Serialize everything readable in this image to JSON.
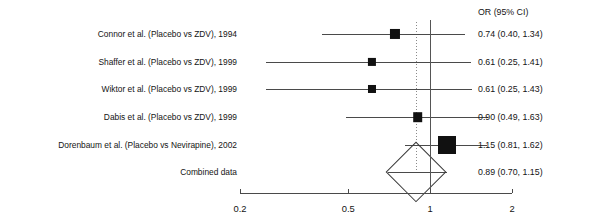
{
  "figure": {
    "type": "forest-plot",
    "title": "",
    "or_header": "OR (95% CI)",
    "x_axis": {
      "scale": "log",
      "ticks": [
        "0.2",
        "0.5",
        "1",
        "2"
      ],
      "tick_values": [
        0.2,
        0.5,
        1,
        2
      ],
      "range": [
        0.2,
        2.0
      ],
      "label": ""
    },
    "null_line_value": 1,
    "summary_line_value": 0.89
  },
  "chart_data": {
    "type": "forest",
    "title": "",
    "xlabel": "",
    "ylabel": "",
    "xscale": "log",
    "xlim": [
      0.2,
      2.0
    ],
    "xticks": [
      0.2,
      0.5,
      1,
      2
    ],
    "xticklabels": [
      "0.2",
      "0.5",
      "1",
      "2"
    ],
    "grid": false,
    "legend": "none",
    "null_line": 1,
    "effect_measure": "OR (95% CI)",
    "rows": [
      {
        "label": "Connor et al. (Placebo vs ZDV), 1994",
        "or": 0.74,
        "lcl": 0.4,
        "ucl": 1.34,
        "or_text": "0.74 (0.40, 1.34)",
        "marker": "square",
        "weight": 0.34
      },
      {
        "label": "Shaffer et al. (Placebo vs ZDV), 1999",
        "or": 0.61,
        "lcl": 0.25,
        "ucl": 1.41,
        "or_text": "0.61 (0.25, 1.41)",
        "marker": "square",
        "weight": 0.18
      },
      {
        "label": "Wiktor et al. (Placebo vs ZDV), 1999",
        "or": 0.61,
        "lcl": 0.25,
        "ucl": 1.43,
        "or_text": "0.61 (0.25, 1.43)",
        "marker": "square",
        "weight": 0.17
      },
      {
        "label": "Dabis et al. (Placebo vs ZDV), 1999",
        "or": 0.9,
        "lcl": 0.49,
        "ucl": 1.63,
        "or_text": "0.90 (0.49, 1.63)",
        "marker": "square",
        "weight": 0.3
      },
      {
        "label": "Dorenbaum et al. (Placebo vs Nevirapine), 2002",
        "or": 1.15,
        "lcl": 0.81,
        "ucl": 1.62,
        "or_text": "1.15 (0.81, 1.62)",
        "marker": "square",
        "weight": 1.0
      },
      {
        "label": "Combined data",
        "or": 0.89,
        "lcl": 0.7,
        "ucl": 1.15,
        "or_text": "0.89 (0.70, 1.15)",
        "marker": "diamond",
        "weight": 0
      }
    ]
  }
}
